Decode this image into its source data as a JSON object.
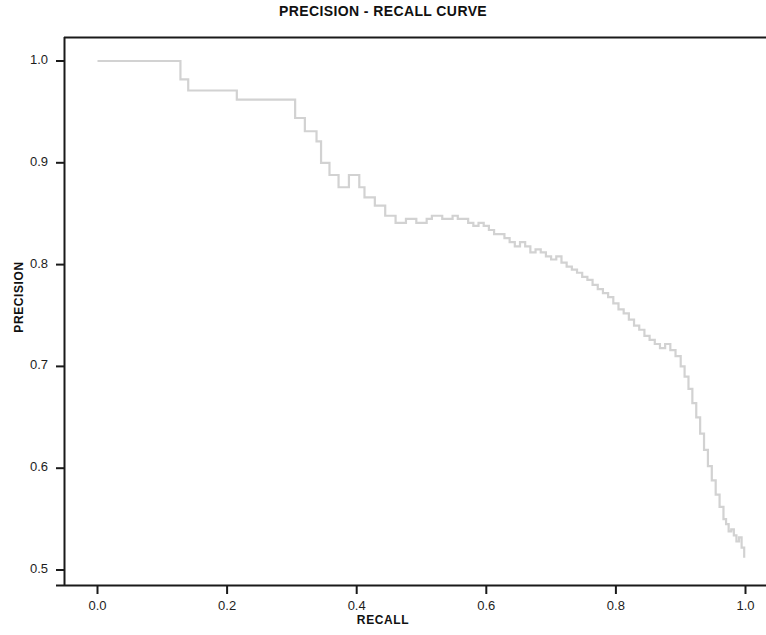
{
  "chart_data": {
    "type": "line",
    "title": "PRECISION - RECALL CURVE",
    "xlabel": "RECALL",
    "ylabel": "PRECISION",
    "xlim": [
      -0.03,
      1.05
    ],
    "ylim": [
      0.485,
      1.02
    ],
    "xticks": [
      "0.0",
      "0.2",
      "0.4",
      "0.6",
      "0.8",
      "1.0"
    ],
    "xtick_values": [
      0.0,
      0.2,
      0.4,
      0.6,
      0.8,
      1.0
    ],
    "yticks": [
      "0.5",
      "0.6",
      "0.7",
      "0.8",
      "0.9",
      "1.0"
    ],
    "ytick_values": [
      0.5,
      0.6,
      0.7,
      0.8,
      0.9,
      1.0
    ],
    "grid": false,
    "legend": "none",
    "line_color": "#d2d2d2",
    "line_width": 2.2,
    "axis_color": "#1a1a1a",
    "background": "#ffffff",
    "drawstyle": "steps-post",
    "series": [
      {
        "name": "precision-recall",
        "x": [
          0.0,
          0.01,
          0.021,
          0.031,
          0.042,
          0.052,
          0.063,
          0.073,
          0.083,
          0.094,
          0.104,
          0.115,
          0.125,
          0.128,
          0.135,
          0.14,
          0.15,
          0.16,
          0.17,
          0.18,
          0.19,
          0.2,
          0.21,
          0.215,
          0.222,
          0.232,
          0.242,
          0.252,
          0.262,
          0.272,
          0.282,
          0.292,
          0.3,
          0.305,
          0.312,
          0.32,
          0.33,
          0.338,
          0.345,
          0.352,
          0.358,
          0.365,
          0.372,
          0.38,
          0.388,
          0.396,
          0.404,
          0.412,
          0.42,
          0.428,
          0.436,
          0.444,
          0.452,
          0.46,
          0.468,
          0.476,
          0.484,
          0.492,
          0.5,
          0.508,
          0.516,
          0.524,
          0.532,
          0.54,
          0.548,
          0.556,
          0.564,
          0.572,
          0.58,
          0.588,
          0.596,
          0.604,
          0.612,
          0.62,
          0.628,
          0.636,
          0.644,
          0.652,
          0.66,
          0.668,
          0.676,
          0.684,
          0.692,
          0.7,
          0.708,
          0.716,
          0.724,
          0.732,
          0.74,
          0.748,
          0.756,
          0.764,
          0.772,
          0.78,
          0.788,
          0.796,
          0.804,
          0.812,
          0.82,
          0.828,
          0.836,
          0.844,
          0.852,
          0.86,
          0.868,
          0.876,
          0.884,
          0.892,
          0.9,
          0.906,
          0.912,
          0.918,
          0.924,
          0.93,
          0.936,
          0.942,
          0.948,
          0.954,
          0.96,
          0.966,
          0.97,
          0.974,
          0.978,
          0.982,
          0.986,
          0.99,
          0.994,
          0.998
        ],
        "y": [
          1.0,
          1.0,
          1.0,
          1.0,
          1.0,
          1.0,
          1.0,
          1.0,
          1.0,
          1.0,
          1.0,
          1.0,
          1.0,
          0.982,
          0.982,
          0.971,
          0.971,
          0.971,
          0.971,
          0.971,
          0.971,
          0.971,
          0.971,
          0.962,
          0.962,
          0.962,
          0.962,
          0.962,
          0.962,
          0.962,
          0.962,
          0.962,
          0.962,
          0.944,
          0.944,
          0.931,
          0.931,
          0.921,
          0.9,
          0.9,
          0.888,
          0.888,
          0.876,
          0.876,
          0.888,
          0.888,
          0.876,
          0.866,
          0.866,
          0.858,
          0.858,
          0.848,
          0.848,
          0.841,
          0.841,
          0.845,
          0.845,
          0.841,
          0.841,
          0.845,
          0.848,
          0.848,
          0.845,
          0.845,
          0.848,
          0.845,
          0.845,
          0.841,
          0.838,
          0.841,
          0.838,
          0.834,
          0.83,
          0.83,
          0.826,
          0.822,
          0.818,
          0.822,
          0.818,
          0.812,
          0.815,
          0.812,
          0.808,
          0.805,
          0.808,
          0.802,
          0.798,
          0.795,
          0.792,
          0.788,
          0.785,
          0.78,
          0.776,
          0.772,
          0.768,
          0.762,
          0.756,
          0.752,
          0.746,
          0.74,
          0.736,
          0.73,
          0.726,
          0.722,
          0.718,
          0.722,
          0.716,
          0.71,
          0.7,
          0.69,
          0.678,
          0.664,
          0.65,
          0.634,
          0.618,
          0.602,
          0.588,
          0.574,
          0.562,
          0.55,
          0.545,
          0.538,
          0.54,
          0.534,
          0.528,
          0.532,
          0.522,
          0.512
        ]
      }
    ]
  },
  "axes": {
    "frame": {
      "left_px": 64,
      "right_px": 766,
      "top_px": 37,
      "bottom_px": 585
    }
  }
}
